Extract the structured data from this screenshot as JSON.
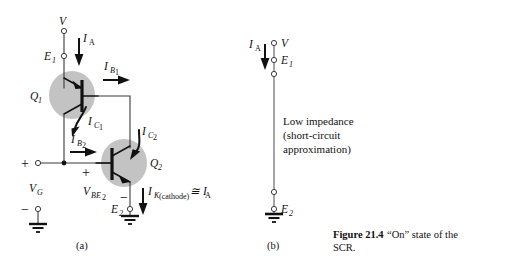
{
  "figure": {
    "caption_bold": "Figure 21.4",
    "caption_rest": "“On” state of the",
    "caption_line2": "SCR."
  },
  "panel_a": {
    "label": "(a)",
    "supply_label": "V",
    "emitter1_label": "E",
    "emitter1_sub": "1",
    "current_ia": "I",
    "current_ia_sub": "A",
    "q1_label": "Q",
    "q1_sub": "1",
    "q2_label": "Q",
    "q2_sub": "2",
    "current_ib1": "I",
    "current_ib1_sub": "B",
    "current_ib1_sub2": "1",
    "current_ic1": "I",
    "current_ic1_sub": "C",
    "current_ic1_sub2": "1",
    "current_ib2": "I",
    "current_ib2_sub": "B",
    "current_ib2_sub2": "2",
    "current_ic2": "I",
    "current_ic2_sub": "C",
    "current_ic2_sub2": "2",
    "vg_label": "V",
    "vg_sub": "G",
    "vbe2_label": "V",
    "vbe2_sub": "BE",
    "vbe2_sub2": "2",
    "emitter2_label": "E",
    "emitter2_sub": "2",
    "ik_label": "I",
    "ik_sub": "K",
    "ik_cathode": "(cathode)",
    "ik_approx": "≅ I",
    "ik_approx_sub": "A",
    "plus_gate": "+",
    "minus_gate": "−",
    "plus_vbe": "+",
    "minus_vbe": "−"
  },
  "panel_b": {
    "label": "(b)",
    "supply_label": "V",
    "emitter1_label": "E",
    "emitter1_sub": "1",
    "emitter2_label": "E",
    "emitter2_sub": "2",
    "current_ia": "I",
    "current_ia_sub": "A",
    "note_line1": "Low impedance",
    "note_line2": "(short-circuit",
    "note_line3": "approximation)"
  },
  "colors": {
    "shade": "#c3c3c3",
    "wire": "#3a3a3a",
    "ink": "#111111",
    "background": "#ffffff"
  }
}
